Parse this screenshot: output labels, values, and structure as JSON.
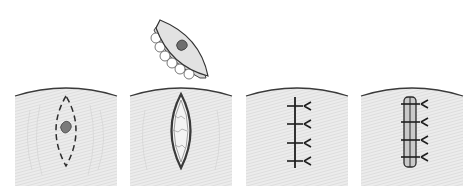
{
  "figure": {
    "panels": [
      {
        "step": 1,
        "name": "marking",
        "content": "dashed elliptical outline drawn around pigmented lesion"
      },
      {
        "step": 2,
        "name": "excision",
        "content": "elliptical skin specimen lifted out above the open elliptical wound"
      },
      {
        "step": 3,
        "name": "suturing",
        "content": "wound closed with four interrupted sutures"
      },
      {
        "step": 4,
        "name": "tie-over dressing",
        "content": "bolster dressing placed over closure and secured with suture ties"
      }
    ],
    "colors": {
      "skin_fill": "#e6e6e6",
      "skin_texture": "#c8c8c8",
      "outline": "#3a3a3a",
      "lesion": "#7a7a7a",
      "wound_fill": "#f2f2f2",
      "bolster": "#cfcfcf"
    }
  }
}
